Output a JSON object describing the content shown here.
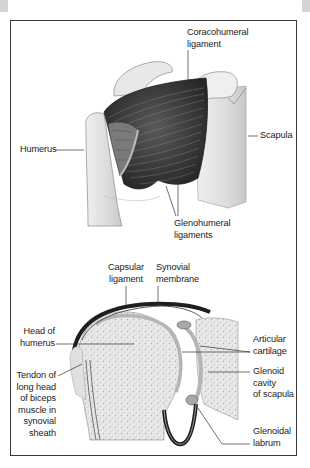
{
  "figure": {
    "top_panel": {
      "title": "Shoulder joint, anterior view",
      "labels": {
        "coracohumeral": "Coracohumeral\nligament",
        "scapula": "Scapula",
        "humerus": "Humerus",
        "glenohumeral": "Glenohumeral\nligaments"
      }
    },
    "bottom_panel": {
      "title": "Shoulder joint, cross-section",
      "labels": {
        "capsular": "Capsular\nligament",
        "synovial_membrane": "Synovial\nmembrane",
        "head_of_humerus": "Head of\nhumerus",
        "tendon": "Tendon of\nlong head\nof biceps\nmuscle in\nsynovial\nsheath",
        "articular_cartilage": "Articular\ncartilage",
        "glenoid_cavity": "Glenoid\ncavity\nof scapula",
        "glenoidal_labrum": "Glenoidal\nlabrum"
      }
    },
    "colors": {
      "frame": "#3a3a3a",
      "bone": "#e4e4e4",
      "bone_shade": "#c8c8c8",
      "ligament": "#3c3c3c",
      "cartilage": "#b5b5b5",
      "capsule": "#1e1e1e",
      "leader": "#333333"
    }
  }
}
